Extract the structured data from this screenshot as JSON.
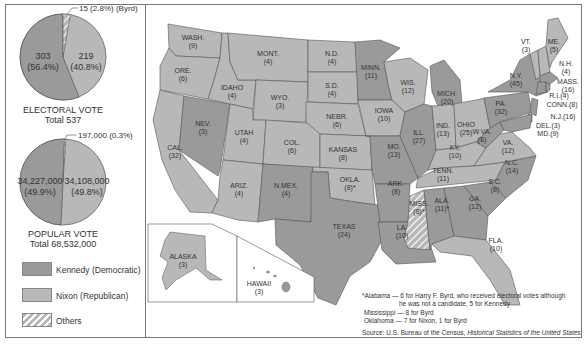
{
  "colors": {
    "kennedy": "#9a9a9a",
    "nixon": "#b8b8b8",
    "others_stripe": "#ffffff",
    "border": "#555555"
  },
  "electoral_pie": {
    "byrd_label": "15 (2.8%) (Byrd)",
    "kennedy_value": "303",
    "kennedy_pct": "(56.4%)",
    "nixon_value": "219",
    "nixon_pct": "(40.8%)",
    "title": "ELECTORAL VOTE",
    "total": "Total 537"
  },
  "popular_pie": {
    "others_label": "197,000 (0.3%)",
    "kennedy_value": "34,227,000",
    "kennedy_pct": "(49.9%)",
    "nixon_value": "34,108,000",
    "nixon_pct": "(49.8%)",
    "title": "POPULAR VOTE",
    "total": "Total 68,532,000"
  },
  "legend": {
    "kennedy": "Kennedy (Democratic)",
    "nixon": "Nixon (Republican)",
    "others": "Others"
  },
  "states": {
    "wash": {
      "name": "WASH.",
      "votes": "(9)",
      "winner": "nixon"
    },
    "ore": {
      "name": "ORE.",
      "votes": "(6)",
      "winner": "nixon"
    },
    "cal": {
      "name": "CAL.",
      "votes": "(32)",
      "winner": "nixon"
    },
    "idaho": {
      "name": "IDAHO",
      "votes": "(4)",
      "winner": "nixon"
    },
    "nev": {
      "name": "NEV.",
      "votes": "(3)",
      "winner": "kennedy"
    },
    "mont": {
      "name": "MONT.",
      "votes": "(4)",
      "winner": "nixon"
    },
    "wyo": {
      "name": "WYO.",
      "votes": "(3)",
      "winner": "nixon"
    },
    "utah": {
      "name": "UTAH",
      "votes": "(4)",
      "winner": "nixon"
    },
    "col": {
      "name": "COL.",
      "votes": "(6)",
      "winner": "nixon"
    },
    "ariz": {
      "name": "ARIZ.",
      "votes": "(4)",
      "winner": "nixon"
    },
    "nmex": {
      "name": "N.MEX.",
      "votes": "(4)",
      "winner": "kennedy"
    },
    "nd": {
      "name": "N.D.",
      "votes": "(4)",
      "winner": "nixon"
    },
    "sd": {
      "name": "S.D.",
      "votes": "(4)",
      "winner": "nixon"
    },
    "nebr": {
      "name": "NEBR.",
      "votes": "(6)",
      "winner": "nixon"
    },
    "kansas": {
      "name": "KANSAS",
      "votes": "(8)",
      "winner": "nixon"
    },
    "okla": {
      "name": "OKLA.",
      "votes": "(8)*",
      "winner": "nixon"
    },
    "texas": {
      "name": "TEXAS",
      "votes": "(24)",
      "winner": "kennedy"
    },
    "minn": {
      "name": "MINN.",
      "votes": "(11)",
      "winner": "kennedy"
    },
    "iowa": {
      "name": "IOWA",
      "votes": "(10)",
      "winner": "nixon"
    },
    "mo": {
      "name": "MO.",
      "votes": "(13)",
      "winner": "kennedy"
    },
    "ark": {
      "name": "ARK.",
      "votes": "(8)",
      "winner": "kennedy"
    },
    "la": {
      "name": "LA.",
      "votes": "(10)",
      "winner": "kennedy"
    },
    "wis": {
      "name": "WIS.",
      "votes": "(12)",
      "winner": "nixon"
    },
    "ill": {
      "name": "ILL.",
      "votes": "(27)",
      "winner": "kennedy"
    },
    "mich": {
      "name": "MICH.",
      "votes": "(20)",
      "winner": "kennedy"
    },
    "ind": {
      "name": "IND.",
      "votes": "(13)",
      "winner": "nixon"
    },
    "ohio": {
      "name": "OHIO",
      "votes": "(25)",
      "winner": "nixon"
    },
    "ky": {
      "name": "KY.",
      "votes": "(10)",
      "winner": "nixon"
    },
    "tenn": {
      "name": "TENN.",
      "votes": "(11)",
      "winner": "nixon"
    },
    "miss": {
      "name": "MISS.",
      "votes": "(8)*",
      "winner": "others"
    },
    "ala": {
      "name": "ALA.",
      "votes": "(11)*",
      "winner": "kennedy"
    },
    "ga": {
      "name": "GA.",
      "votes": "(12)",
      "winner": "kennedy"
    },
    "fla": {
      "name": "FLA.",
      "votes": "(10)",
      "winner": "nixon"
    },
    "sc": {
      "name": "S.C.",
      "votes": "(8)",
      "winner": "kennedy"
    },
    "nc": {
      "name": "N.C.",
      "votes": "(14)",
      "winner": "kennedy"
    },
    "va": {
      "name": "VA.",
      "votes": "(12)",
      "winner": "nixon"
    },
    "wva": {
      "name": "W.VA.",
      "votes": "(8)",
      "winner": "kennedy"
    },
    "pa": {
      "name": "PA.",
      "votes": "(32)",
      "winner": "kennedy"
    },
    "ny": {
      "name": "N.Y.",
      "votes": "(45)",
      "winner": "kennedy"
    },
    "vt": {
      "name": "VT.",
      "votes": "(3)",
      "winner": "nixon"
    },
    "nh": {
      "name": "N.H.",
      "votes": "(4)",
      "winner": "nixon"
    },
    "me": {
      "name": "ME.",
      "votes": "(5)",
      "winner": "nixon"
    },
    "mass": {
      "name": "MASS.",
      "votes": "(16)",
      "winner": "kennedy"
    },
    "ri": {
      "name": "R.I.",
      "votes": "(4)",
      "winner": "kennedy"
    },
    "conn": {
      "name": "CONN.",
      "votes": "(8)",
      "winner": "kennedy"
    },
    "nj": {
      "name": "N.J.",
      "votes": "(16)",
      "winner": "kennedy"
    },
    "del": {
      "name": "DEL.",
      "votes": "(3)",
      "winner": "kennedy"
    },
    "md": {
      "name": "MD.",
      "votes": "(9)",
      "winner": "kennedy"
    },
    "alaska": {
      "name": "ALASKA",
      "votes": "(3)",
      "winner": "nixon"
    },
    "hawaii": {
      "name": "HAWAII",
      "votes": "(3)",
      "winner": "kennedy"
    }
  },
  "labels_inline": {
    "ri": "R.I.(4)",
    "conn": "CONN.(8)",
    "nj": "N.J.(16)",
    "del": "DEL.(3)",
    "md": "MD.(9)"
  },
  "footnote": {
    "line1": "*Alabama — 6 for Harry F. Byrd, who received electoral votes although",
    "line2": "he was not a candidate, 5 for Kennedy",
    "line3": "Mississippi — 8 for Byrd",
    "line4": "Oklahoma — 7 for Nixon, 1 for Byrd"
  },
  "source": {
    "prefix": "Source: U.S. Bureau of the Census, ",
    "title": "Historical Statistics of the United States"
  }
}
